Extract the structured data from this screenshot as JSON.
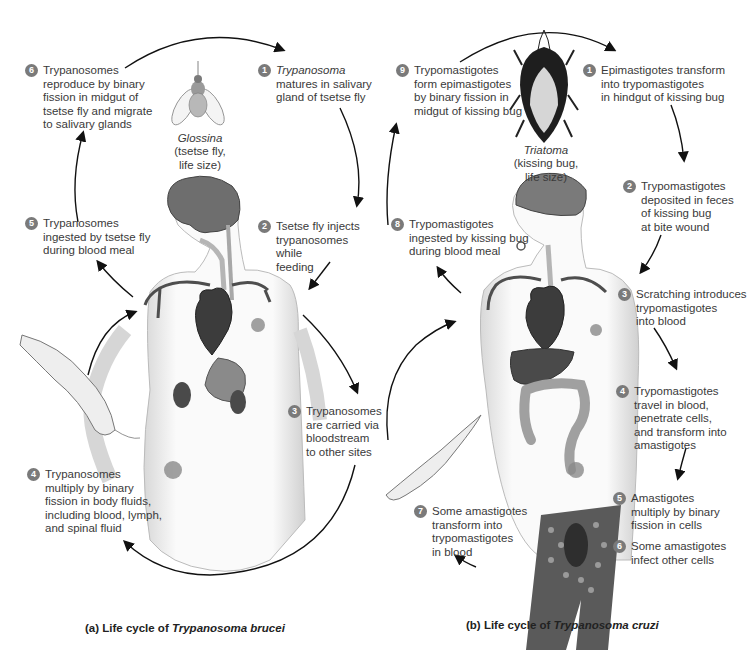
{
  "figure": {
    "panels": [
      {
        "id": "a",
        "caption_prefix": "(a) Life cycle of ",
        "caption_species": "Trypanosoma brucei",
        "vector": {
          "genus": "Glossina",
          "description": "(tsetse fly,\nlife size)"
        },
        "steps": [
          {
            "n": "1",
            "italic_lead": "Trypanosoma",
            "text": "\nmatures in salivary\ngland of tsetse fly"
          },
          {
            "n": "2",
            "italic_lead": "",
            "text": "Tsetse fly injects\ntrypanosomes while\nfeeding"
          },
          {
            "n": "3",
            "italic_lead": "",
            "text": "Trypanosomes\nare carried via\nbloodstream\nto other sites"
          },
          {
            "n": "4",
            "italic_lead": "",
            "text": "Trypanosomes\nmultiply by binary\nfission in body fluids,\nincluding blood, lymph,\nand spinal fluid"
          },
          {
            "n": "5",
            "italic_lead": "",
            "text": "Trypanosomes\ningested by tsetse fly\nduring blood meal"
          },
          {
            "n": "6",
            "italic_lead": "",
            "text": "Trypanosomes\nreproduce by binary\nfission in midgut of\ntsetse fly and migrate\nto salivary glands"
          }
        ]
      },
      {
        "id": "b",
        "caption_prefix": "(b) Life cycle of ",
        "caption_species": "Trypanosoma cruzi",
        "vector": {
          "genus": "Triatoma",
          "description": "(kissing bug,\nlife size)"
        },
        "steps": [
          {
            "n": "1",
            "italic_lead": "",
            "text": "Epimastigotes transform\ninto trypomastigotes\nin hindgut of kissing bug"
          },
          {
            "n": "2",
            "italic_lead": "",
            "text": "Trypomastigotes\ndeposited in feces\nof kissing bug\nat bite wound"
          },
          {
            "n": "3",
            "italic_lead": "",
            "text": "Scratching introduces\ntrypomastigotes\ninto blood"
          },
          {
            "n": "4",
            "italic_lead": "",
            "text": "Trypomastigotes\ntravel in blood,\npenetrate cells,\nand transform into\namastigotes"
          },
          {
            "n": "5",
            "italic_lead": "",
            "text": "Amastigotes\nmultiply by binary\nfission in cells"
          },
          {
            "n": "6",
            "italic_lead": "",
            "text": "Some amastigotes\ninfect other cells"
          },
          {
            "n": "7",
            "italic_lead": "",
            "text": "Some amastigotes\ntransform into\ntrypomastigotes\nin blood"
          },
          {
            "n": "8",
            "italic_lead": "",
            "text": "Trypomastigotes\ningested by kissing bug\nduring blood meal"
          },
          {
            "n": "9",
            "italic_lead": "",
            "text": "Trypomastigotes\nform epimastigotes\nby binary fission in\nmidgut of kissing bug"
          }
        ]
      }
    ],
    "colors": {
      "badge": "#7a7a7a",
      "heart": "#3c3c3c",
      "organ_dark": "#4a4a4a",
      "brain": "#6e6e6e",
      "arrow": "#111111"
    }
  }
}
